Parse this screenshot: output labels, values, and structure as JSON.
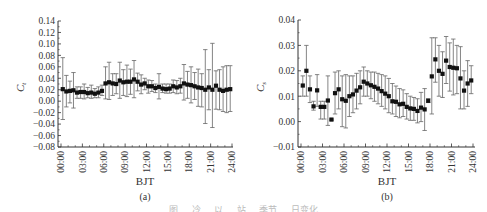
{
  "figure": {
    "caption": "图 … 冷 … 以 … 站 … 季节 … 日变化"
  },
  "chart_data": [
    {
      "panel": "(a)",
      "type": "scatter",
      "subtype": "scatter-with-errorbars",
      "title": "",
      "xlabel": "BJT",
      "ylabel": "C_t",
      "ylabel_main": "C",
      "ylabel_sub": "t",
      "xlim": [
        0,
        24
      ],
      "ylim": [
        -0.08,
        0.14
      ],
      "x_ticks": [
        "00:00",
        "03:00",
        "06:00",
        "09:00",
        "12:00",
        "15:00",
        "18:00",
        "21:00",
        "24:00"
      ],
      "y_ticks": [
        "0.14",
        "0.12",
        "0.10",
        "0.08",
        "0.06",
        "0.04",
        "0.02",
        "0.00",
        "−0.02",
        "−0.04",
        "−0.06",
        "−0.08"
      ],
      "grid": false,
      "marker": "square",
      "marker_color": "#111111",
      "errorbar_color": "#666666",
      "x": [
        0.25,
        0.75,
        1.25,
        1.75,
        2.25,
        2.75,
        3.25,
        3.75,
        4.25,
        4.75,
        5.25,
        5.75,
        6.25,
        6.75,
        7.25,
        7.75,
        8.25,
        8.75,
        9.25,
        9.75,
        10.25,
        10.75,
        11.25,
        11.75,
        12.25,
        12.75,
        13.25,
        13.75,
        14.25,
        14.75,
        15.25,
        15.75,
        16.25,
        16.75,
        17.25,
        17.75,
        18.25,
        18.75,
        19.25,
        19.75,
        20.25,
        20.75,
        21.25,
        21.75,
        22.25,
        22.75,
        23.25,
        23.75
      ],
      "values": [
        0.021,
        0.017,
        0.018,
        0.019,
        0.015,
        0.016,
        0.016,
        0.014,
        0.015,
        0.013,
        0.015,
        0.018,
        0.031,
        0.033,
        0.031,
        0.03,
        0.036,
        0.033,
        0.034,
        0.034,
        0.038,
        0.034,
        0.029,
        0.031,
        0.026,
        0.026,
        0.023,
        0.025,
        0.022,
        0.021,
        0.022,
        0.026,
        0.024,
        0.026,
        0.031,
        0.029,
        0.028,
        0.026,
        0.024,
        0.023,
        0.02,
        0.024,
        0.02,
        0.027,
        0.02,
        0.018,
        0.02,
        0.021
      ],
      "err_upper": [
        0.076,
        0.045,
        0.035,
        0.05,
        0.025,
        0.025,
        0.03,
        0.024,
        0.028,
        0.022,
        0.025,
        0.028,
        0.06,
        0.068,
        0.048,
        0.048,
        0.068,
        0.055,
        0.063,
        0.056,
        0.071,
        0.049,
        0.046,
        0.04,
        0.037,
        0.036,
        0.03,
        0.048,
        0.03,
        0.03,
        0.03,
        0.037,
        0.036,
        0.04,
        0.064,
        0.052,
        0.06,
        0.05,
        0.056,
        0.048,
        0.09,
        0.055,
        0.101,
        0.053,
        0.055,
        0.06,
        0.062,
        0.062
      ],
      "err_lower": [
        -0.032,
        -0.01,
        -0.003,
        -0.012,
        0.005,
        0.005,
        0.004,
        0.006,
        0.005,
        0.006,
        0.006,
        0.01,
        0.004,
        0.003,
        0.01,
        0.013,
        0.005,
        0.01,
        0.008,
        0.012,
        0.006,
        0.018,
        0.013,
        0.02,
        0.014,
        0.017,
        0.015,
        0.004,
        0.015,
        0.014,
        0.014,
        0.015,
        0.013,
        0.014,
        0.002,
        0.005,
        -0.003,
        0.003,
        -0.009,
        -0.01,
        -0.039,
        -0.015,
        -0.046,
        -0.014,
        -0.015,
        -0.018,
        -0.02,
        -0.018
      ]
    },
    {
      "panel": "(b)",
      "type": "scatter",
      "subtype": "scatter-with-errorbars",
      "title": "",
      "xlabel": "BJT",
      "ylabel": "C_s",
      "ylabel_main": "C",
      "ylabel_sub": "s",
      "xlim": [
        0,
        24
      ],
      "ylim": [
        -0.01,
        0.04
      ],
      "x_ticks": [
        "00:00",
        "03:00",
        "06:00",
        "09:00",
        "12:00",
        "15:00",
        "18:00",
        "21:00",
        "24:00"
      ],
      "y_ticks": [
        "0.04",
        "0.03",
        "0.02",
        "0.01",
        "0.00",
        "−0.01"
      ],
      "grid": false,
      "marker": "square",
      "marker_color": "#111111",
      "errorbar_color": "#666666",
      "x": [
        0.25,
        0.75,
        1.25,
        1.75,
        2.25,
        2.75,
        3.25,
        3.75,
        4.25,
        4.75,
        5.25,
        5.75,
        6.25,
        6.75,
        7.25,
        7.75,
        8.25,
        8.75,
        9.25,
        9.75,
        10.25,
        10.75,
        11.25,
        11.75,
        12.25,
        12.75,
        13.25,
        13.75,
        14.25,
        14.75,
        15.25,
        15.75,
        16.25,
        16.75,
        17.25,
        17.75,
        18.25,
        18.75,
        19.25,
        19.75,
        20.25,
        20.75,
        21.25,
        21.75,
        22.25,
        22.75,
        23.25,
        23.75
      ],
      "values": [
        0.0142,
        0.02,
        0.0127,
        0.006,
        0.0123,
        0.0058,
        0.0058,
        0.0083,
        0.0008,
        0.0112,
        0.0127,
        0.0088,
        0.0082,
        0.01,
        0.0107,
        0.0122,
        0.0135,
        0.0157,
        0.015,
        0.0143,
        0.0137,
        0.013,
        0.012,
        0.011,
        0.01,
        0.008,
        0.0078,
        0.0068,
        0.007,
        0.0058,
        0.0052,
        0.005,
        0.0042,
        0.0055,
        0.0048,
        0.0082,
        0.0178,
        0.0245,
        0.02,
        0.0188,
        0.024,
        0.0215,
        0.0212,
        0.021,
        0.017,
        0.0122,
        0.015,
        0.0162
      ],
      "err_upper": [
        0.018,
        0.03,
        0.018,
        0.008,
        0.0185,
        0.008,
        0.008,
        0.018,
        0.001,
        0.0195,
        0.02,
        0.018,
        0.0185,
        0.018,
        0.018,
        0.019,
        0.02,
        0.0215,
        0.02,
        0.0195,
        0.0195,
        0.019,
        0.0185,
        0.018,
        0.017,
        0.015,
        0.014,
        0.013,
        0.0125,
        0.011,
        0.01,
        0.0095,
        0.009,
        0.0115,
        0.013,
        0.009,
        0.033,
        0.033,
        0.03,
        0.0275,
        0.0335,
        0.031,
        0.0325,
        0.03,
        0.0295,
        0.02,
        0.024,
        0.022
      ],
      "err_lower": [
        0.01,
        0.01,
        0.0075,
        0.0045,
        0.006,
        0.001,
        0.001,
        -0.0015,
        0.0005,
        0.003,
        0.005,
        -0.002,
        -0.0025,
        0.002,
        0.0035,
        0.005,
        0.007,
        0.01,
        0.01,
        0.009,
        0.008,
        0.007,
        0.006,
        0.005,
        0.0035,
        0.003,
        0.002,
        0.0015,
        0.002,
        0.001,
        0.0005,
        0.0005,
        -0.0005,
        0.0,
        -0.0035,
        0.0075,
        0.003,
        0.0155,
        0.01,
        0.0095,
        0.015,
        0.012,
        0.0105,
        0.011,
        0.005,
        0.005,
        0.006,
        0.011
      ]
    }
  ]
}
